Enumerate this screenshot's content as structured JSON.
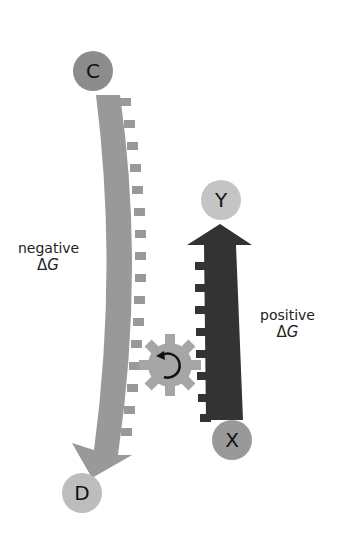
{
  "diagram": {
    "title": "",
    "nodes": {
      "C": {
        "label": "C",
        "color": "#8c8c8c"
      },
      "D": {
        "label": "D",
        "color": "#bdbdbd"
      },
      "Y": {
        "label": "Y",
        "color": "#c4c4c4"
      },
      "X": {
        "label": "X",
        "color": "#999999"
      }
    },
    "arrows": {
      "left": {
        "from": "C",
        "to": "D",
        "color": "#999999",
        "direction": "down"
      },
      "right": {
        "from": "X",
        "to": "Y",
        "color": "#333333",
        "direction": "up"
      }
    },
    "gear": {
      "color": "#a6a6a6",
      "rotation_icon": "clockwise-arrow",
      "rotation_color": "#111111"
    },
    "labels": {
      "negative": {
        "word": "negative",
        "delta": "Δ",
        "symbol": "G"
      },
      "positive": {
        "word": "positive",
        "delta": "Δ",
        "symbol": "G"
      }
    }
  }
}
